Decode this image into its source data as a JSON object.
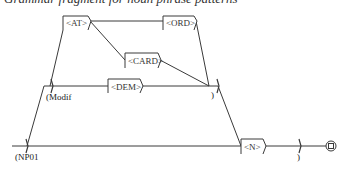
{
  "caption": "Grammar fragment for noun phrase patterns",
  "graph": {
    "boxes": [
      {
        "id": "at",
        "label": "<AT>"
      },
      {
        "id": "ord",
        "label": "<ORD>"
      },
      {
        "id": "card",
        "label": "<CARD>"
      },
      {
        "id": "dem",
        "label": "<DEM>"
      },
      {
        "id": "n",
        "label": "<N>"
      }
    ],
    "brackets": {
      "np01_open": "(NP01",
      "modif_open": "(Modif",
      "modif_close": ")",
      "np01_close": ")"
    },
    "final_state": "final-state"
  },
  "colors": {
    "line": "#3a3a3a",
    "box_border": "#3a3a3a",
    "background": "#ffffff"
  }
}
